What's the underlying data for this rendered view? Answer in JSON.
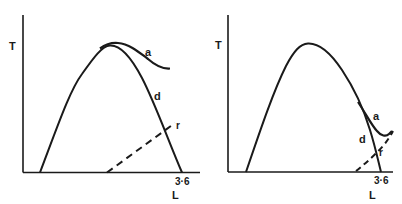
{
  "panels": [
    {
      "id": "left",
      "y_axis_label": "T",
      "x_axis_label": "L",
      "x_tick_label": "3·6",
      "curves": [
        {
          "name": "a",
          "label": "a",
          "style": "solid"
        },
        {
          "name": "d",
          "label": "d",
          "style": "solid"
        },
        {
          "name": "r",
          "label": "r",
          "style": "dashed"
        }
      ]
    },
    {
      "id": "right",
      "y_axis_label": "T",
      "x_axis_label": "L",
      "x_tick_label": "3·6",
      "curves": [
        {
          "name": "a",
          "label": "a",
          "style": "solid"
        },
        {
          "name": "d",
          "label": "d",
          "style": "solid"
        },
        {
          "name": "r",
          "label": "r",
          "style": "dashed"
        }
      ]
    }
  ],
  "colors": {
    "line": "#1a1a1a",
    "background": "#ffffff"
  }
}
